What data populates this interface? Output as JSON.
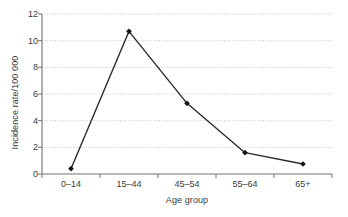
{
  "chart_data": {
    "type": "line",
    "title": "",
    "subtitle": "",
    "xlabel": "Age group",
    "ylabel": "Incidence rate/100 000",
    "categories": [
      "0–14",
      "15–44",
      "45–54",
      "55–64",
      "65+"
    ],
    "values": [
      0.4,
      10.7,
      5.3,
      1.6,
      0.75
    ],
    "series": [
      {
        "name": "Incidence rate",
        "values": [
          0.4,
          10.7,
          5.3,
          1.6,
          0.75
        ]
      }
    ],
    "ylim": [
      0,
      12
    ],
    "yticks": [
      0,
      2,
      4,
      6,
      8,
      10,
      12
    ],
    "ytick_labels": [
      "0",
      "2",
      "4",
      "6",
      "8",
      "10",
      "12"
    ],
    "xtick_labels": [
      "0–14",
      "15–44",
      "45–54",
      "55–64",
      "65+"
    ],
    "grid": "horizontal-dotted",
    "legend": "none",
    "marker": "filled-diamond",
    "line_color": "#2b2b2b",
    "marker_color": "#111111",
    "grid_color": "#b9b9b9",
    "axis_color": "#7d7d7d",
    "text_color": "#3a3a3a",
    "background": "#ffffff"
  }
}
